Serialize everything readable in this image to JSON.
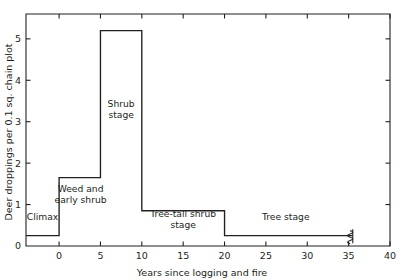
{
  "chart_data": {
    "type": "line",
    "subtype": "step-post",
    "title": "",
    "xlabel": "Years since logging and fire",
    "ylabel": "Deer droppings per 0.1 sq. chain plot",
    "xlim": [
      -4,
      40
    ],
    "ylim": [
      0,
      5.6
    ],
    "xticks": [
      0,
      5,
      10,
      15,
      20,
      25,
      30,
      35,
      40
    ],
    "xticklabels": [
      "0",
      "5",
      "10",
      "15",
      "20",
      "25",
      "30",
      "35",
      "40"
    ],
    "yticks": [
      0,
      1,
      2,
      3,
      4,
      5
    ],
    "yticklabels": [
      "0",
      "1",
      "2",
      "3",
      "4",
      "5"
    ],
    "grid": false,
    "legend": false,
    "frame": "box",
    "tick_direction": "in",
    "axis_break": {
      "x": 35.5,
      "symbol": "squiggle",
      "note": "line terminates with break mark"
    },
    "steps": [
      {
        "stage": "Climax",
        "x_start": -4,
        "x_end": 0,
        "value": 0.25
      },
      {
        "stage": "Weed and early shrub",
        "x_start": 0,
        "x_end": 5,
        "value": 1.65
      },
      {
        "stage": "Shrub stage",
        "x_start": 5,
        "x_end": 10,
        "value": 5.2
      },
      {
        "stage": "Tree-tall shrub stage",
        "x_start": 10,
        "x_end": 20,
        "value": 0.85
      },
      {
        "stage": "Tree stage",
        "x_start": 20,
        "x_end": 35.5,
        "value": 0.25
      }
    ],
    "x": [
      -4,
      0,
      0,
      5,
      5,
      10,
      10,
      20,
      20,
      35.5
    ],
    "values": [
      0.25,
      0.25,
      1.65,
      1.65,
      5.2,
      5.2,
      0.85,
      0.85,
      0.25,
      0.25
    ],
    "annotations": [
      {
        "text": "Climax",
        "x": -2.0,
        "y": 0.62,
        "lines": [
          "Climax"
        ]
      },
      {
        "text": "Weed and early shrub",
        "x": 2.6,
        "y": 1.3,
        "lines": [
          "Weed and",
          "early shrub"
        ]
      },
      {
        "text": "Shrub stage",
        "x": 7.5,
        "y": 3.35,
        "lines": [
          "Shrub",
          "stage"
        ]
      },
      {
        "text": "Tree-tall shrub stage",
        "x": 15.0,
        "y": 0.7,
        "lines": [
          "Tree-tall shrub",
          "stage"
        ]
      },
      {
        "text": "Tree stage",
        "x": 27.4,
        "y": 0.62,
        "lines": [
          "Tree stage"
        ]
      }
    ]
  },
  "colors": {
    "line": "#231f20",
    "axis": "#231f20",
    "background": "#ffffff",
    "text": "#231f20"
  }
}
